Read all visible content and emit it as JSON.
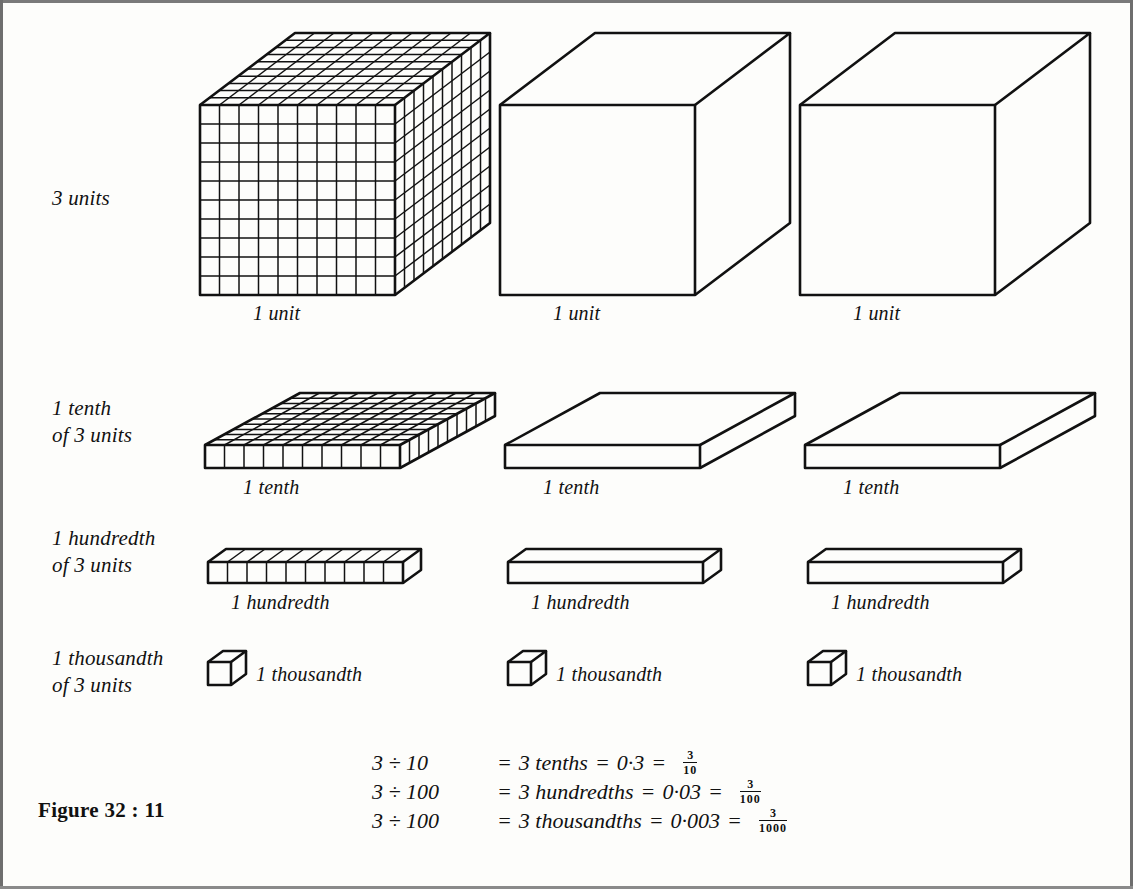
{
  "figure": {
    "number_label": "Figure 32 : 11",
    "rows": [
      {
        "id": "units",
        "label": "3 units",
        "captions": [
          "1 unit",
          "1 unit",
          "1 unit"
        ],
        "shape": "cube",
        "gridded_first": true,
        "grid_divisions": 10
      },
      {
        "id": "tenths",
        "label": "1 tenth\nof 3 units",
        "captions": [
          "1 tenth",
          "1 tenth",
          "1 tenth"
        ],
        "shape": "slab",
        "gridded_first": true,
        "grid_divisions": 10
      },
      {
        "id": "hundredths",
        "label": "1 hundredth\nof 3 units",
        "captions": [
          "1 hundredth",
          "1 hundredth",
          "1 hundredth"
        ],
        "shape": "rod",
        "gridded_first": true,
        "grid_divisions": 10
      },
      {
        "id": "thousandths",
        "label": "1 thousandth\nof 3 units",
        "captions": [
          "1 thousandth",
          "1 thousandth",
          "1 thousandth"
        ],
        "shape": "small-cube",
        "gridded_first": false,
        "grid_divisions": 1
      }
    ],
    "equations": [
      {
        "lhs": "3 ÷ 10",
        "equals1": "=",
        "words": "3 tenths",
        "equals2": "=",
        "decimal": "0·3",
        "equals3": "=",
        "fraction_numerator": "3",
        "fraction_denominator": "10"
      },
      {
        "lhs": "3 ÷ 100",
        "equals1": "=",
        "words": "3 hundredths",
        "equals2": "=",
        "decimal": "0·03",
        "equals3": "=",
        "fraction_numerator": "3",
        "fraction_denominator": "100"
      },
      {
        "lhs": "3 ÷ 100",
        "equals1": "=",
        "words": "3 thousandths",
        "equals2": "=",
        "decimal": "0·003",
        "equals3": "=",
        "fraction_numerator": "3",
        "fraction_denominator": "1000"
      }
    ],
    "colors": {
      "ink": "#111111",
      "paper": "#fdfdfb",
      "edge_rule": "#6e6e6e"
    }
  }
}
